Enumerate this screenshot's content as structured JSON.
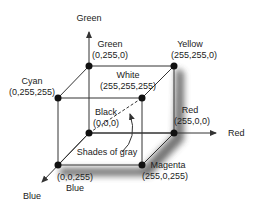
{
  "diagram": {
    "axes": {
      "green": "Green",
      "red": "Red",
      "blue": "Blue"
    },
    "vertices": {
      "green": {
        "name": "Green",
        "rgb": "(0,255,0)"
      },
      "yellow": {
        "name": "Yellow",
        "rgb": "(255,255,0)"
      },
      "cyan": {
        "name": "Cyan",
        "rgb": "(0,255,255)"
      },
      "white": {
        "name": "White",
        "rgb": "(255,255,255)"
      },
      "black": {
        "name": "Black",
        "rgb": "(0,0,0)"
      },
      "red": {
        "name": "Red",
        "rgb": "(255,0,0)"
      },
      "blue": {
        "name": "Blue",
        "rgb": "(0,0,255)"
      },
      "magenta": {
        "name": "Magenta",
        "rgb": "(255,0,255)"
      }
    },
    "annotation": "Shades of gray",
    "colors": {
      "line": "#333333",
      "vertex": "#111111",
      "shadow": "#444444"
    }
  }
}
